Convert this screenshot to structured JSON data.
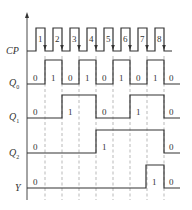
{
  "diagram": {
    "type": "timing-diagram",
    "axis": {
      "x": 27,
      "top": 12,
      "bottom": 200
    },
    "edges_x": [
      45,
      62,
      79,
      96,
      113,
      130,
      147,
      164
    ],
    "dash_range": {
      "top": 56,
      "bottom": 200
    },
    "colors": {
      "line": "#333333",
      "dash": "#8a8a8a",
      "background": "#ffffff"
    },
    "signals": [
      {
        "id": "cp",
        "label": "CP",
        "subscript": "",
        "label_x": 6,
        "label_y": 54,
        "high_y": 28,
        "low_y": 51,
        "points": [
          [
            27,
            51
          ],
          [
            36,
            51
          ],
          [
            36,
            28
          ],
          [
            45,
            28
          ],
          [
            45,
            51
          ],
          [
            53,
            51
          ],
          [
            53,
            28
          ],
          [
            62,
            28
          ],
          [
            62,
            51
          ],
          [
            70,
            51
          ],
          [
            70,
            28
          ],
          [
            79,
            28
          ],
          [
            79,
            51
          ],
          [
            87,
            51
          ],
          [
            87,
            28
          ],
          [
            96,
            28
          ],
          [
            96,
            51
          ],
          [
            104,
            51
          ],
          [
            104,
            28
          ],
          [
            113,
            28
          ],
          [
            113,
            51
          ],
          [
            121,
            51
          ],
          [
            121,
            28
          ],
          [
            130,
            28
          ],
          [
            130,
            51
          ],
          [
            138,
            51
          ],
          [
            138,
            28
          ],
          [
            147,
            28
          ],
          [
            147,
            51
          ],
          [
            155,
            51
          ],
          [
            155,
            28
          ],
          [
            164,
            28
          ],
          [
            164,
            51
          ],
          [
            172,
            51
          ]
        ],
        "pulse_numbers": [
          {
            "text": "1",
            "x": 38,
            "y": 42
          },
          {
            "text": "2",
            "x": 55,
            "y": 42
          },
          {
            "text": "3",
            "x": 72,
            "y": 42
          },
          {
            "text": "4",
            "x": 89,
            "y": 42
          },
          {
            "text": "5",
            "x": 106,
            "y": 42
          },
          {
            "text": "6",
            "x": 123,
            "y": 42
          },
          {
            "text": "7",
            "x": 140,
            "y": 42
          },
          {
            "text": "8",
            "x": 157,
            "y": 42
          }
        ],
        "falling_edge_arrows": true
      },
      {
        "id": "q0",
        "label": "Q",
        "subscript": "0",
        "label_x": 9,
        "label_y": 86,
        "high_y": 60,
        "low_y": 84,
        "points": [
          [
            27,
            84
          ],
          [
            45,
            84
          ],
          [
            45,
            60
          ],
          [
            62,
            60
          ],
          [
            62,
            84
          ],
          [
            79,
            84
          ],
          [
            79,
            60
          ],
          [
            96,
            60
          ],
          [
            96,
            84
          ],
          [
            113,
            84
          ],
          [
            113,
            60
          ],
          [
            130,
            60
          ],
          [
            130,
            84
          ],
          [
            147,
            84
          ],
          [
            147,
            60
          ],
          [
            164,
            60
          ],
          [
            164,
            84
          ],
          [
            180,
            84
          ]
        ],
        "values": [
          {
            "text": "0",
            "x": 33,
            "y": 81
          },
          {
            "text": "1",
            "x": 51,
            "y": 81
          },
          {
            "text": "0",
            "x": 68,
            "y": 81
          },
          {
            "text": "1",
            "x": 85,
            "y": 81
          },
          {
            "text": "0",
            "x": 102,
            "y": 81
          },
          {
            "text": "1",
            "x": 119,
            "y": 81
          },
          {
            "text": "0",
            "x": 136,
            "y": 81
          },
          {
            "text": "1",
            "x": 153,
            "y": 81
          },
          {
            "text": "0",
            "x": 169,
            "y": 81
          }
        ]
      },
      {
        "id": "q1",
        "label": "Q",
        "subscript": "1",
        "label_x": 9,
        "label_y": 120,
        "high_y": 95,
        "low_y": 118,
        "points": [
          [
            27,
            118
          ],
          [
            62,
            118
          ],
          [
            62,
            95
          ],
          [
            96,
            95
          ],
          [
            96,
            118
          ],
          [
            130,
            118
          ],
          [
            130,
            95
          ],
          [
            164,
            95
          ],
          [
            164,
            118
          ],
          [
            180,
            118
          ]
        ],
        "values": [
          {
            "text": "0",
            "x": 33,
            "y": 115
          },
          {
            "text": "1",
            "x": 68,
            "y": 115
          },
          {
            "text": "0",
            "x": 102,
            "y": 115
          },
          {
            "text": "1",
            "x": 136,
            "y": 115
          },
          {
            "text": "0",
            "x": 169,
            "y": 115
          }
        ]
      },
      {
        "id": "q2",
        "label": "Q",
        "subscript": "2",
        "label_x": 9,
        "label_y": 156,
        "high_y": 130,
        "low_y": 153,
        "points": [
          [
            27,
            153
          ],
          [
            96,
            153
          ],
          [
            96,
            130
          ],
          [
            164,
            130
          ],
          [
            164,
            153
          ],
          [
            180,
            153
          ]
        ],
        "values": [
          {
            "text": "0",
            "x": 33,
            "y": 150
          },
          {
            "text": "1",
            "x": 102,
            "y": 150
          },
          {
            "text": "0",
            "x": 169,
            "y": 150
          }
        ]
      },
      {
        "id": "y",
        "label": "Y",
        "subscript": "",
        "label_x": 15,
        "label_y": 191,
        "high_y": 165,
        "low_y": 188,
        "points": [
          [
            27,
            188
          ],
          [
            146,
            188
          ],
          [
            146,
            165
          ],
          [
            164,
            165
          ],
          [
            164,
            188
          ],
          [
            180,
            188
          ]
        ],
        "values": [
          {
            "text": "0",
            "x": 33,
            "y": 185
          },
          {
            "text": "1",
            "x": 152,
            "y": 185
          },
          {
            "text": "0",
            "x": 169,
            "y": 185
          }
        ]
      }
    ]
  }
}
